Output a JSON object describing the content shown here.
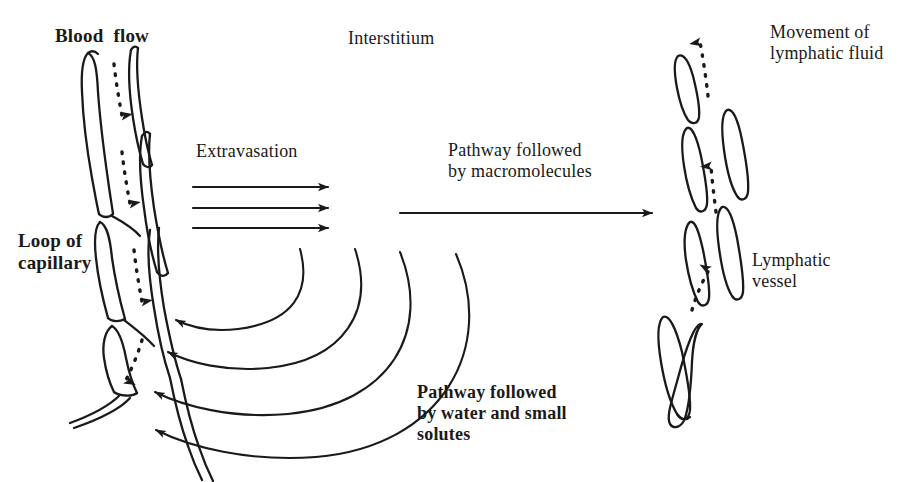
{
  "figure": {
    "background_color": "#ffffff",
    "ink_color": "#1a1a1a",
    "width": 904,
    "height": 482
  },
  "labels": {
    "blood_flow": "Blood  flow",
    "interstitium": "Interstitium",
    "extravasation": "Extravasation",
    "pathway_macromolecules": "Pathway followed\nby macromolecules",
    "loop_of_capillary": "Loop of\ncapillary",
    "movement_of_lymphatic_fluid": "Movement of\nlymphatic fluid",
    "lymphatic_vessel": "Lymphatic\nvessel",
    "pathway_water_solutes": "Pathway followed\nby water and small\nsolutes"
  },
  "structures": {
    "capillary": {
      "name": "Loop of capillary",
      "position": "left",
      "description": "Hairpin loop of capillary drawn as paired endothelial outlines with segmented cell boundaries",
      "flow_direction": "downward",
      "flow_marker": "dotted arrows"
    },
    "lymphatic": {
      "name": "Lymphatic vessel",
      "position": "right",
      "description": "Blind-ended lymphatic capillary drawn as overlapping endothelial flaps forming open junctions",
      "flow_direction": "upward",
      "flow_marker": "dotted arrows"
    },
    "interstitium": {
      "name": "Interstitium",
      "position": "centre",
      "description": "Open space between the capillary loop and the lymphatic vessel"
    }
  },
  "flows": [
    {
      "id": "blood-flow",
      "label": "Blood  flow",
      "style": "dotted",
      "direction": "down",
      "count": 4,
      "region": "capillary"
    },
    {
      "id": "extravasation",
      "label": "Extravasation",
      "style": "solid",
      "direction": "right",
      "count": 3,
      "region": "capillary-to-interstitium"
    },
    {
      "id": "macromolecule-pathway",
      "label": "Pathway followed by macromolecules",
      "style": "solid",
      "direction": "right",
      "count": 1,
      "region": "interstitium-to-lymphatic"
    },
    {
      "id": "water-solute-pathway",
      "label": "Pathway followed by water and small solutes",
      "style": "solid-curved",
      "direction": "left-returning",
      "count": 4,
      "region": "interstitium-back-to-capillary"
    },
    {
      "id": "lymphatic-fluid-movement",
      "label": "Movement of lymphatic fluid",
      "style": "dotted",
      "direction": "up",
      "count": 3,
      "region": "lymphatic"
    }
  ]
}
